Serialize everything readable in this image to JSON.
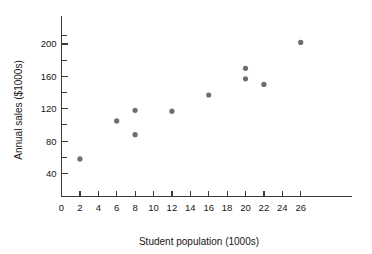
{
  "chart_data": {
    "type": "scatter",
    "title": "",
    "xlabel": "Student population (1000s)",
    "ylabel": "Annual sales ($1000s)",
    "xlim": [
      0,
      27.5
    ],
    "ylim": [
      25,
      215
    ],
    "grid": false,
    "legend": null,
    "x_ticks": [
      0,
      2,
      4,
      6,
      8,
      10,
      12,
      14,
      16,
      18,
      20,
      22,
      24,
      26
    ],
    "x_tick_labels": [
      "0",
      "2",
      "4",
      "6",
      "8",
      "10",
      "12",
      "14",
      "16",
      "18",
      "20",
      "22",
      "24",
      "26"
    ],
    "y_ticks": [
      40,
      80,
      120,
      160,
      200
    ],
    "y_tick_labels": [
      "40",
      "80",
      "120",
      "160",
      "200"
    ],
    "y_minor_ticks": [
      60,
      100,
      140,
      180,
      210
    ],
    "point_color": "#6d6d72",
    "axis_color": "#3a3a3a",
    "background_color": "#ffffff",
    "points": [
      {
        "x": 2,
        "y": 58
      },
      {
        "x": 6,
        "y": 105
      },
      {
        "x": 8,
        "y": 88
      },
      {
        "x": 8,
        "y": 118
      },
      {
        "x": 12,
        "y": 117
      },
      {
        "x": 16,
        "y": 137
      },
      {
        "x": 20,
        "y": 157
      },
      {
        "x": 20,
        "y": 170
      },
      {
        "x": 22,
        "y": 150
      },
      {
        "x": 26,
        "y": 202
      }
    ],
    "series": [
      {
        "name": "Restaurant sales vs student population",
        "x": [
          2,
          6,
          8,
          8,
          12,
          16,
          20,
          20,
          22,
          26
        ],
        "values": [
          58,
          105,
          88,
          118,
          117,
          137,
          157,
          170,
          150,
          202
        ]
      }
    ]
  }
}
